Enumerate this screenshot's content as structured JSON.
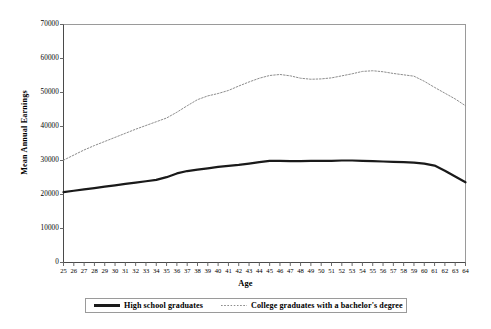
{
  "chart_data": {
    "type": "line",
    "title": "",
    "xlabel": "Age",
    "ylabel": "Mean Annual Earnings",
    "xlim": [
      25,
      64
    ],
    "ylim": [
      0,
      70000
    ],
    "grid": false,
    "legend_position": "bottom",
    "ytick_labels": [
      "0",
      "10000",
      "20000",
      "30000",
      "40000",
      "50000",
      "60000",
      "70000"
    ],
    "ytick_values": [
      0,
      10000,
      20000,
      30000,
      40000,
      50000,
      60000,
      70000
    ],
    "x": [
      25,
      26,
      27,
      28,
      29,
      30,
      31,
      32,
      33,
      34,
      35,
      36,
      37,
      38,
      39,
      40,
      41,
      42,
      43,
      44,
      45,
      46,
      47,
      48,
      49,
      50,
      51,
      52,
      53,
      54,
      55,
      56,
      57,
      58,
      59,
      60,
      61,
      62,
      63,
      64
    ],
    "xtick_labels": [
      "25",
      "26",
      "27",
      "28",
      "29",
      "30",
      "31",
      "32",
      "33",
      "34",
      "35",
      "36",
      "37",
      "38",
      "39",
      "40",
      "41",
      "42",
      "43",
      "44",
      "45",
      "46",
      "47",
      "48",
      "49",
      "50",
      "51",
      "52",
      "53",
      "54",
      "55",
      "56",
      "57",
      "58",
      "59",
      "60",
      "61",
      "62",
      "63",
      "64"
    ],
    "series": [
      {
        "name": "High school graduates",
        "style": "solid",
        "color": "#1a1a1a",
        "width": 2.2,
        "values": [
          20700,
          21100,
          21500,
          21900,
          22300,
          22700,
          23100,
          23500,
          23900,
          24300,
          25100,
          26200,
          26900,
          27300,
          27700,
          28100,
          28400,
          28700,
          29100,
          29500,
          29900,
          29900,
          29800,
          29800,
          29900,
          29900,
          29900,
          30000,
          30000,
          29900,
          29800,
          29700,
          29600,
          29500,
          29400,
          29100,
          28500,
          27000,
          25300,
          23600
        ]
      },
      {
        "name": "College graduates with a bachelor's degree",
        "style": "dotted",
        "color": "#8d8d8d",
        "width": 1.0,
        "values": [
          30100,
          31600,
          33100,
          34400,
          35600,
          36800,
          38000,
          39200,
          40300,
          41400,
          42500,
          44200,
          46100,
          47900,
          49000,
          49700,
          50600,
          51900,
          53100,
          54200,
          55000,
          55300,
          54900,
          54200,
          53900,
          54000,
          54300,
          54900,
          55500,
          56200,
          56400,
          56100,
          55600,
          55200,
          54800,
          53300,
          51500,
          49800,
          48100,
          46100
        ]
      }
    ]
  },
  "legend": {
    "entries": [
      {
        "label": "High school graduates"
      },
      {
        "label": "College graduates with a bachelor's degree"
      }
    ]
  }
}
